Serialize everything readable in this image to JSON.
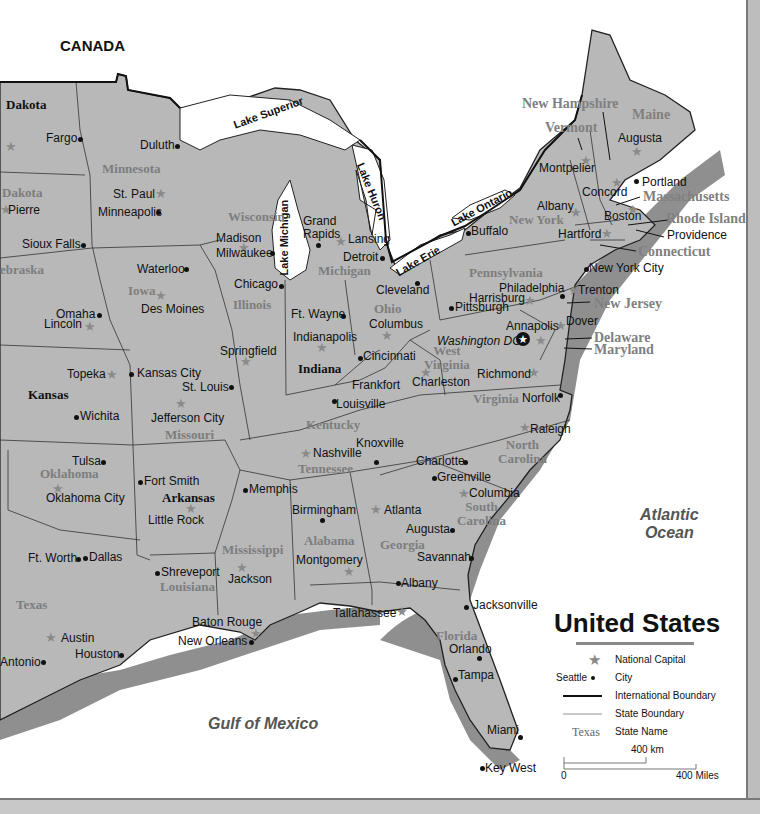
{
  "map": {
    "title": "United States",
    "colors": {
      "land": "#b8b8b8",
      "water": "#ffffff",
      "coast_shadow": "#8f8f8f",
      "state_label": "#7d7d7d",
      "text": "#111111"
    },
    "country_label": "CANADA",
    "oceans": [
      {
        "name": "atlantic",
        "line1": "Atlantic",
        "line2": "Ocean"
      },
      {
        "name": "gulf",
        "line1": "Gulf of Mexico"
      }
    ],
    "lakes": [
      "Lake Superior",
      "Lake Michigan",
      "Lake Huron",
      "Lake Erie",
      "Lake Ontario"
    ],
    "states": {
      "north_dakota": "Dakota",
      "south_dakota": "Dakota",
      "nebraska": "ebraska",
      "kansas": "Kansas",
      "oklahoma": "Oklahoma",
      "texas": "Texas",
      "minnesota": "Minnesota",
      "iowa": "Iowa",
      "missouri": "Missouri",
      "arkansas": "Arkansas",
      "louisiana": "Louisiana",
      "wisconsin": "Wisconsin",
      "illinois": "Illinois",
      "mississippi": "Mississippi",
      "michigan": "Michigan",
      "indiana": "Indiana",
      "ohio": "Ohio",
      "kentucky": "Kentucky",
      "tennessee": "Tennessee",
      "alabama": "Alabama",
      "georgia": "Georgia",
      "florida": "Florida",
      "south_carolina_1": "South",
      "south_carolina_2": "Carolina",
      "north_carolina_1": "North",
      "north_carolina_2": "Carolina",
      "virginia": "Virginia",
      "west_virginia_1": "West",
      "west_virginia_2": "Virginia",
      "pennsylvania": "Pennsylvania",
      "new_york": "New York",
      "new_jersey": "New Jersey",
      "delaware": "Delaware",
      "maryland": "Maryland",
      "connecticut": "Connecticut",
      "rhode_island": "Rhode Island",
      "massachusetts": "Massachusetts",
      "vermont": "Vermont",
      "new_hampshire": "New Hampshire",
      "maine": "Maine"
    },
    "capitals": {
      "bismarck_partial": "",
      "pierre": "Pierre",
      "st_paul": "St. Paul",
      "madison": "Madison",
      "lansing": "Lansing",
      "des_moines": "Des Moines",
      "lincoln": "Lincoln",
      "topeka": "Topeka",
      "jefferson_city": "Jefferson City",
      "springfield": "Springfield",
      "indianapolis": "Indianapolis",
      "columbus_oh": "Columbus",
      "frankfort": "Frankfort",
      "charleston": "Charleston",
      "richmond": "Richmond",
      "annapolis": "Annapolis",
      "dover": "Dover",
      "trenton": "Trenton",
      "harrisburg": "Harrisburg",
      "albany_ny": "Albany",
      "hartford": "Hartford",
      "providence": "Providence",
      "boston": "Boston",
      "concord": "Concord",
      "montpelier": "Montpelier",
      "augusta_me": "Augusta",
      "nashville": "Nashville",
      "raleigh": "Raleigh",
      "columbia": "Columbia",
      "atlanta": "Atlanta",
      "montgomery": "Montgomery",
      "tallahassee": "Tallahassee",
      "jackson": "Jackson",
      "baton_rouge": "Baton Rouge",
      "little_rock": "Little Rock",
      "oklahoma_city": "Oklahoma City",
      "austin": "Austin",
      "washington_dc": "Washington DC"
    },
    "cities": {
      "fargo": "Fargo",
      "sioux_falls": "Sioux Falls",
      "duluth": "Duluth",
      "minneapolis": "Minneapolis",
      "milwaukee": "Milwaukee",
      "grand_rapids_1": "Grand",
      "grand_rapids_2": "Rapids",
      "detroit": "Detroit",
      "chicago": "Chicago",
      "waterloo": "Waterloo",
      "omaha": "Omaha",
      "kansas_city": "Kansas City",
      "st_louis": "St. Louis",
      "wichita": "Wichita",
      "tulsa": "Tulsa",
      "fort_smith": "Fort Smith",
      "ft_worth": "Ft. Worth",
      "dallas": "Dallas",
      "shreveport": "Shreveport",
      "houston": "Houston",
      "san_antonio": "Antonio",
      "new_orleans": "New Orleans",
      "memphis": "Memphis",
      "ft_wayne": "Ft. Wayne",
      "cincinnati": "Cincinnati",
      "louisville": "Louisville",
      "cleveland": "Cleveland",
      "pittsburgh": "Pittsburgh",
      "philadelphia": "Philadelphia",
      "buffalo": "Buffalo",
      "new_york_city": "New York City",
      "portland": "Portland",
      "norfolk": "Norfolk",
      "knoxville": "Knoxville",
      "charlotte": "Charlotte",
      "greenville": "Greenville",
      "birmingham": "Birmingham",
      "augusta_ga": "Augusta",
      "savannah": "Savannah",
      "albany_ga": "Albany",
      "jacksonville": "Jacksonville",
      "orlando": "Orlando",
      "tampa": "Tampa",
      "miami": "Miami",
      "key_west": "Key West"
    },
    "legend": {
      "title": "United States",
      "items": [
        {
          "symbol": "star",
          "label": "National Capital"
        },
        {
          "symbol": "dot",
          "sample": "Seattle",
          "label": "City"
        },
        {
          "symbol": "thick-line",
          "label": "International Boundary"
        },
        {
          "symbol": "thin-line",
          "label": "State Boundary"
        },
        {
          "symbol": "state-name",
          "sample": "Texas",
          "label": "State Name"
        }
      ],
      "scale": {
        "km_label": "400 km",
        "zero": "0",
        "miles_label": "400 Miles"
      }
    }
  }
}
